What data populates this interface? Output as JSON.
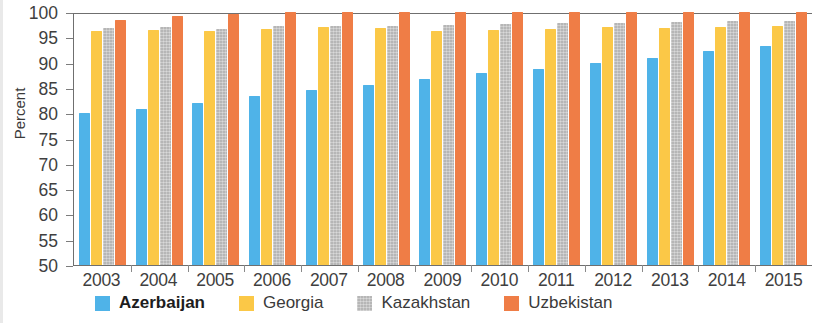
{
  "chart_data": {
    "type": "bar",
    "title": "",
    "xlabel": "",
    "ylabel": "Percent",
    "ylim": [
      50,
      100
    ],
    "ytick_step": 5,
    "yticks": [
      100,
      95,
      90,
      85,
      80,
      75,
      70,
      65,
      60,
      55,
      50
    ],
    "grid": false,
    "legend_position": "bottom",
    "categories": [
      "2003",
      "2004",
      "2005",
      "2006",
      "2007",
      "2008",
      "2009",
      "2010",
      "2011",
      "2012",
      "2013",
      "2014",
      "2015"
    ],
    "series": [
      {
        "name": "Azerbaijan",
        "color": "#4fb3e8",
        "emphasis": true,
        "values": [
          80.0,
          80.8,
          82.0,
          83.4,
          84.5,
          85.5,
          86.7,
          88.0,
          88.7,
          90.0,
          91.0,
          92.2,
          93.2
        ]
      },
      {
        "name": "Georgia",
        "color": "#fbc847",
        "emphasis": false,
        "values": [
          96.3,
          96.4,
          96.3,
          96.7,
          97.0,
          96.8,
          96.3,
          96.5,
          96.7,
          97.1,
          96.9,
          97.0,
          97.2
        ]
      },
      {
        "name": "Kazakhstan",
        "color": "#b6b6b6",
        "emphasis": false,
        "values": [
          96.8,
          97.0,
          96.7,
          97.2,
          97.3,
          97.2,
          97.4,
          97.6,
          97.8,
          97.9,
          98.0,
          98.2,
          98.3
        ]
      },
      {
        "name": "Uzbekistan",
        "color": "#ef7d46",
        "emphasis": false,
        "values": [
          98.5,
          99.3,
          99.7,
          100.0,
          100.0,
          100.0,
          100.0,
          100.0,
          100.0,
          100.0,
          100.0,
          100.0,
          100.0
        ]
      }
    ]
  }
}
